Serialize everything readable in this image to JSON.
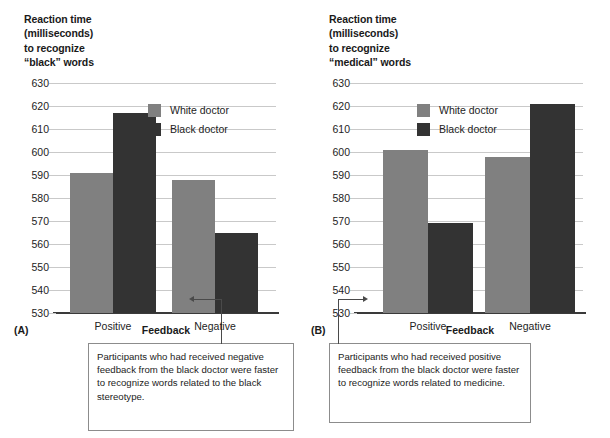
{
  "figure": {
    "background": "#ffffff",
    "colors": {
      "white_doctor": "#808080",
      "black_doctor": "#333333",
      "gridline": "#c9c9c9",
      "axis": "#3a3a3a",
      "text": "#232323",
      "callout_border": "#8c8c8c"
    }
  },
  "panels": [
    {
      "letter": "(A)",
      "title": "Reaction time\n(milliseconds)\nto recognize\n“black” words",
      "axis_title": "Feedback",
      "legend": [
        {
          "label": "White doctor",
          "color": "#808080"
        },
        {
          "label": "Black doctor",
          "color": "#333333"
        }
      ],
      "callout": "Participants who had received negative feedback from the black doctor were faster to recognize words related to the black stereotype."
    },
    {
      "letter": "(B)",
      "title": "Reaction time\n(milliseconds)\nto recognize\n“medical” words",
      "axis_title": "Feedback",
      "legend": [
        {
          "label": "White doctor",
          "color": "#808080"
        },
        {
          "label": "Black doctor",
          "color": "#333333"
        }
      ],
      "callout": "Participants who had received positive feedback from the black doctor were faster to recognize words related to medicine."
    }
  ],
  "chart_data": [
    {
      "type": "bar",
      "panel": "(A)",
      "title": "Reaction time (milliseconds) to recognize “black” words",
      "xlabel": "Feedback",
      "ylabel": "Reaction time (milliseconds) to recognize “black” words",
      "categories": [
        "Positive",
        "Negative"
      ],
      "series": [
        {
          "name": "White doctor",
          "color": "#808080",
          "values": [
            591,
            588
          ]
        },
        {
          "name": "Black doctor",
          "color": "#333333",
          "values": [
            617,
            565
          ]
        }
      ],
      "ylim": [
        530,
        630
      ],
      "yticks": [
        530,
        540,
        550,
        560,
        570,
        580,
        590,
        600,
        610,
        620,
        630
      ],
      "grid": true,
      "legend_position": "upper-center",
      "annotation": "Participants who had received negative feedback from the black doctor were faster to recognize words related to the black stereotype.",
      "annotation_target": "Negative / Black doctor"
    },
    {
      "type": "bar",
      "panel": "(B)",
      "title": "Reaction time (milliseconds) to recognize “medical” words",
      "xlabel": "Feedback",
      "ylabel": "Reaction time (milliseconds) to recognize “medical” words",
      "categories": [
        "Positive",
        "Negative"
      ],
      "series": [
        {
          "name": "White doctor",
          "color": "#808080",
          "values": [
            601,
            598
          ]
        },
        {
          "name": "Black doctor",
          "color": "#333333",
          "values": [
            569,
            621
          ]
        }
      ],
      "ylim": [
        530,
        630
      ],
      "yticks": [
        530,
        540,
        550,
        560,
        570,
        580,
        590,
        600,
        610,
        620,
        630
      ],
      "grid": true,
      "legend_position": "upper-left",
      "annotation": "Participants who had received positive feedback from the black doctor were faster to recognize words related to medicine.",
      "annotation_target": "Positive / Black doctor"
    }
  ]
}
